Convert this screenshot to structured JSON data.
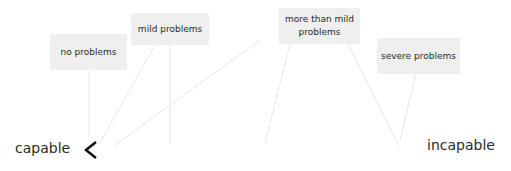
{
  "diagram": {
    "scale": {
      "left_label": "capable",
      "right_label": "incapable",
      "arrow_direction": "left"
    },
    "categories": [
      {
        "id": "no",
        "label": "no problems"
      },
      {
        "id": "mild",
        "label": "mild problems"
      },
      {
        "id": "more",
        "label": "more than mild problems"
      },
      {
        "id": "severe",
        "label": "severe problems"
      }
    ],
    "colors": {
      "box_fill": "#efefef",
      "arrow_dark": "#111111",
      "connector": "#e6e6e6",
      "text": "#2a2a2a"
    }
  }
}
